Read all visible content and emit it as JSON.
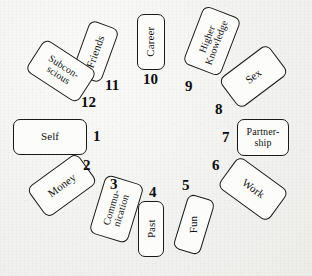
{
  "diagram": {
    "background_color": "#f4f4f2",
    "card_fill": "#fcfcfb",
    "card_stroke": "#1a1a1a",
    "text_color": "#111111",
    "number_color": "#0d0d0d"
  },
  "houses": [
    {
      "number": "1",
      "label": "Self",
      "card": {
        "x": 13,
        "y": 119,
        "w": 74,
        "h": 36,
        "rotate": 0,
        "text_rotate": 0,
        "font_size": 11
      },
      "number_pos": {
        "x": 93,
        "y": 129
      }
    },
    {
      "number": "2",
      "label": "Money",
      "card": {
        "x": 31,
        "y": 167,
        "w": 62,
        "h": 37,
        "rotate": -36,
        "text_rotate": -36,
        "font_size": 11
      },
      "number_pos": {
        "x": 83,
        "y": 158
      }
    },
    {
      "number": "3",
      "label": "Commu-\nnication",
      "card": {
        "x": 86,
        "y": 189,
        "w": 61,
        "h": 40,
        "rotate": -73,
        "text_rotate": -73,
        "font_size": 10
      },
      "number_pos": {
        "x": 110,
        "y": 177
      }
    },
    {
      "number": "4",
      "label": "Past",
      "card": {
        "x": 138,
        "y": 201,
        "w": 26,
        "h": 56,
        "rotate": 0,
        "text_rotate": -90,
        "font_size": 11
      },
      "number_pos": {
        "x": 149,
        "y": 185
      }
    },
    {
      "number": "5",
      "label": "Fun",
      "card": {
        "x": 180,
        "y": 196,
        "w": 28,
        "h": 57,
        "rotate": 17,
        "text_rotate": -90,
        "font_size": 11
      },
      "number_pos": {
        "x": 182,
        "y": 178
      }
    },
    {
      "number": "6",
      "label": "Work",
      "card": {
        "x": 222,
        "y": 170,
        "w": 62,
        "h": 38,
        "rotate": 36,
        "text_rotate": 36,
        "font_size": 11
      },
      "number_pos": {
        "x": 212,
        "y": 158
      }
    },
    {
      "number": "7",
      "label": "Partner-\nship",
      "card": {
        "x": 237,
        "y": 119,
        "w": 52,
        "h": 37,
        "rotate": 0,
        "text_rotate": 0,
        "font_size": 10
      },
      "number_pos": {
        "x": 222,
        "y": 130
      }
    },
    {
      "number": "8",
      "label": "Sex",
      "card": {
        "x": 223,
        "y": 58,
        "w": 61,
        "h": 37,
        "rotate": -37,
        "text_rotate": -37,
        "font_size": 11
      },
      "number_pos": {
        "x": 215,
        "y": 102
      }
    },
    {
      "number": "9",
      "label": "Higher\nKnowledge",
      "card": {
        "x": 181,
        "y": 21,
        "w": 62,
        "h": 40,
        "rotate": -69,
        "text_rotate": -69,
        "font_size": 10
      },
      "number_pos": {
        "x": 185,
        "y": 79
      }
    },
    {
      "number": "10",
      "label": "Career",
      "card": {
        "x": 137,
        "y": 14,
        "w": 28,
        "h": 56,
        "rotate": 0,
        "text_rotate": -90,
        "font_size": 11
      },
      "number_pos": {
        "x": 143,
        "y": 72
      }
    },
    {
      "number": "11",
      "label": "Friends",
      "card": {
        "x": 80,
        "y": 23,
        "w": 31,
        "h": 57,
        "rotate": 20,
        "text_rotate": -70,
        "font_size": 11
      },
      "number_pos": {
        "x": 105,
        "y": 78
      }
    },
    {
      "number": "12",
      "label": "Subcon-\nscious",
      "card": {
        "x": 30,
        "y": 52,
        "w": 62,
        "h": 38,
        "rotate": 33,
        "text_rotate": 33,
        "font_size": 10
      },
      "number_pos": {
        "x": 81,
        "y": 95
      }
    }
  ]
}
